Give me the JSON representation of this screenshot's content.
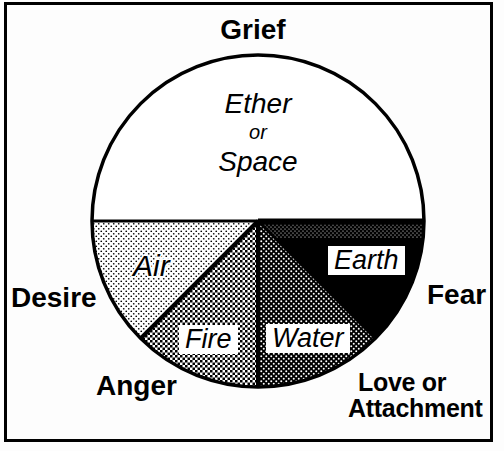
{
  "emotions": {
    "top": "Grief",
    "left": "Desire",
    "bottom_left": "Anger",
    "bottom_right": [
      "Love or",
      "Attachment"
    ],
    "right": "Fear"
  },
  "center_region": {
    "line1": "Ether",
    "line2": "or",
    "line3": "Space"
  },
  "segments": [
    {
      "label": "Air",
      "fill": "light-halftone-dots"
    },
    {
      "label": "Fire",
      "fill": "medium-halftone-checker"
    },
    {
      "label": "Water",
      "fill": "dark-halftone-dots"
    },
    {
      "label": "Earth",
      "fill": "solid-black"
    }
  ],
  "colors": {
    "ink": "#000000",
    "paper": "#ffffff"
  }
}
